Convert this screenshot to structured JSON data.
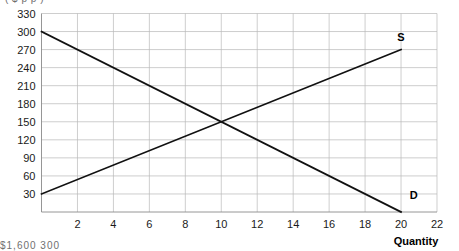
{
  "top_clipped_text": "( $  p                  p )",
  "bottom_clipped_text": "$1,600   300",
  "chart_data": {
    "type": "line",
    "title": "",
    "xlabel": "Quantity",
    "ylabel": "",
    "xlim": [
      0,
      22
    ],
    "ylim": [
      0,
      330
    ],
    "grid": true,
    "legend_position": "inline-end-of-line",
    "x_ticks": [
      2,
      4,
      6,
      8,
      10,
      12,
      14,
      16,
      18,
      20,
      22
    ],
    "y_ticks": [
      30,
      60,
      90,
      120,
      150,
      180,
      210,
      240,
      270,
      300,
      330
    ],
    "equilibrium": {
      "quantity": 10,
      "price": 150
    },
    "series": [
      {
        "name": "S",
        "label": "S",
        "label_position": {
          "x": 20,
          "y": 285
        },
        "points": [
          {
            "x": 0,
            "y": 30
          },
          {
            "x": 20,
            "y": 270
          }
        ]
      },
      {
        "name": "D",
        "label": "D",
        "label_position": {
          "x": 20.7,
          "y": 22
        },
        "points": [
          {
            "x": 0,
            "y": 300
          },
          {
            "x": 20,
            "y": 0
          }
        ]
      }
    ]
  }
}
